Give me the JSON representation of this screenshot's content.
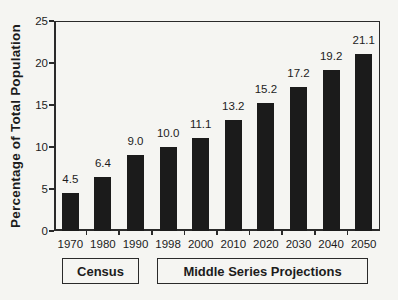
{
  "figure": {
    "background": "#f5f5f2",
    "bar_color": "#1b1b1b",
    "axis_color": "#2a2a2a",
    "text_color": "#1c1c1c"
  },
  "chart_data": {
    "type": "bar",
    "categories": [
      "1970",
      "1980",
      "1990",
      "1998",
      "2000",
      "2010",
      "2020",
      "2030",
      "2040",
      "2050"
    ],
    "values": [
      4.5,
      6.4,
      9.0,
      10.0,
      11.1,
      13.2,
      15.2,
      17.2,
      19.2,
      21.1
    ],
    "title": "",
    "xlabel": "",
    "ylabel": "Percentage of Total Population",
    "ylim": [
      0,
      25
    ],
    "yticks": [
      0,
      5,
      10,
      15,
      20,
      25
    ],
    "grid": false,
    "legend_position": "none",
    "bar_labels_shown": true,
    "group_labels": [
      {
        "label": "Census",
        "start": "1970",
        "end": "1990"
      },
      {
        "label": "Middle Series Projections",
        "start": "1998",
        "end": "2050"
      }
    ]
  }
}
